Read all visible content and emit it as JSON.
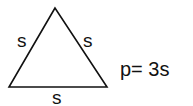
{
  "figure": {
    "shape": "equilateral-triangle",
    "side_labels": {
      "left": "s",
      "right": "s",
      "bottom": "s"
    },
    "formula": "p= 3s",
    "stroke_color": "#111111",
    "background": "#ffffff"
  }
}
